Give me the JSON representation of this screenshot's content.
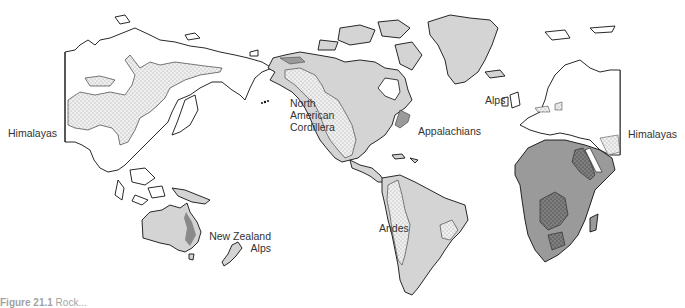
{
  "figure": {
    "caption_prefix": "Figure 21.1",
    "caption_text": "Rock..."
  },
  "legend_colors": {
    "land_unshaded": "#ffffff",
    "americas_australia_fill": "#d4d4d4",
    "africa_fill": "#9a9a9a",
    "mountain_stipple": "#eeeeee",
    "outline": "#111111"
  },
  "labels": {
    "himalayas_left": "Himalayas",
    "north_american_cordillera": [
      "North",
      "American",
      "Cordillera"
    ],
    "appalachians": "Appalachians",
    "alps": "Alps",
    "himalayas_right": "Himalayas",
    "andes": "Andes",
    "new_zealand_alps": [
      "New Zealand",
      "Alps"
    ]
  }
}
